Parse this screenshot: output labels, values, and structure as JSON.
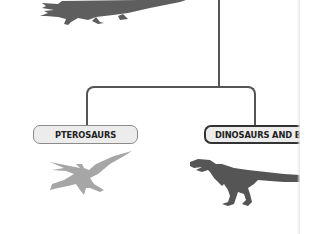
{
  "diagram": {
    "type": "phylogenetic-tree",
    "nodes": [
      {
        "id": "crocodilians",
        "label": "",
        "silhouette": "crocodile-silhouette",
        "color": "#5e5e5e"
      },
      {
        "id": "pterosaurs",
        "label": "PTEROSAURS",
        "silhouette": "pterosaur-silhouette",
        "color": "#a6a6a6"
      },
      {
        "id": "dinosaurs",
        "label": "DINOSAURS AND BIRD",
        "silhouette": "trex-silhouette",
        "color": "#555555"
      }
    ],
    "edges": [
      {
        "from": "root",
        "to": "pterosaurs"
      },
      {
        "from": "root",
        "to": "dinosaurs"
      }
    ]
  },
  "colors": {
    "line": "#555555",
    "box_fill": "#ececec",
    "box_border_light": "#8a8a8a",
    "box_border_dark": "#333333"
  }
}
